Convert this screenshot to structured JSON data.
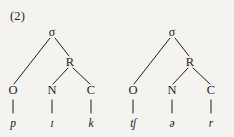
{
  "figure": {
    "example_number": "(2)",
    "caption": "",
    "background_color": "#f4f3f0",
    "ink_color": "#1c1c1c"
  },
  "trees": [
    {
      "id": "tree-1",
      "word_gloss": "pick",
      "nodes": {
        "root": "σ",
        "onset": "O",
        "rhyme": "R",
        "nucleus": "N",
        "coda": "C"
      },
      "segments": {
        "onset": "p",
        "nucleus": "ɪ",
        "coda": "k"
      }
    },
    {
      "id": "tree-2",
      "word_gloss": "chur",
      "nodes": {
        "root": "σ",
        "onset": "O",
        "rhyme": "R",
        "nucleus": "N",
        "coda": "C"
      },
      "segments": {
        "onset": "tʃ",
        "nucleus": "ə",
        "coda": "r"
      }
    }
  ]
}
